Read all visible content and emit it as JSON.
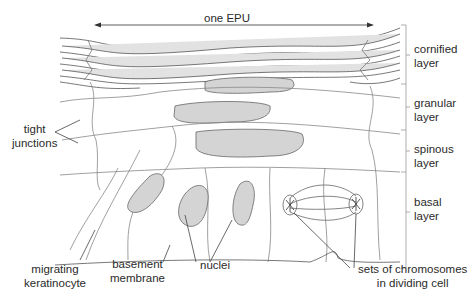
{
  "title": "one EPU",
  "layers": [
    {
      "id": "cornified",
      "line1": "cornified",
      "line2": "layer"
    },
    {
      "id": "granular",
      "line1": "granular",
      "line2": "layer"
    },
    {
      "id": "spinous",
      "line1": "spinous",
      "line2": "layer"
    },
    {
      "id": "basal",
      "line1": "basal",
      "line2": "layer"
    }
  ],
  "labels": {
    "tight_junctions": {
      "line1": "tight",
      "line2": "junctions"
    },
    "migrating_keratinocyte": {
      "line1": "migrating",
      "line2": "keratinocyte"
    },
    "basement_membrane": {
      "line1": "basement",
      "line2": "membrane"
    },
    "nuclei": "nuclei",
    "chromosomes": {
      "line1": "sets of chromosomes",
      "line2": "in dividing cell"
    }
  },
  "colors": {
    "nucleus_fill": "#d4d4d4",
    "line": "#555555",
    "cornified_fill": "#dcdcdc"
  }
}
